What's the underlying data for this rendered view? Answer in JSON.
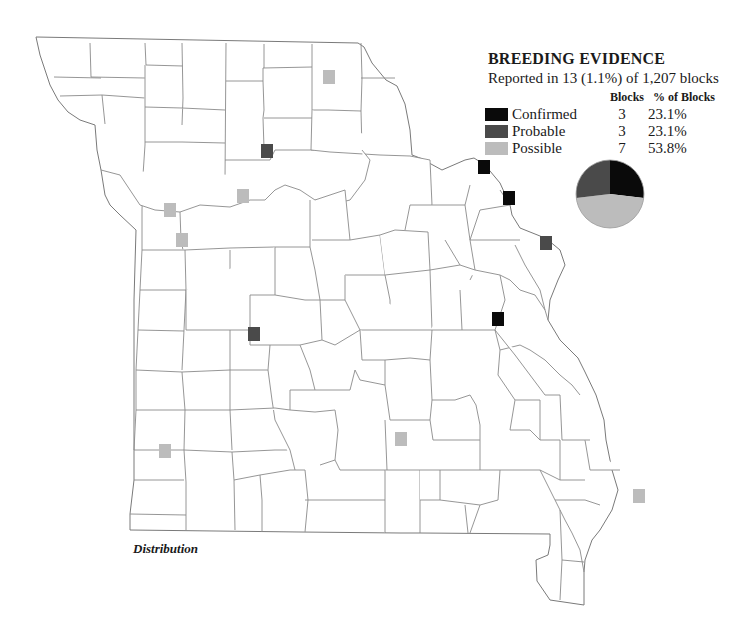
{
  "legend": {
    "title": "BREEDING EVIDENCE",
    "subtitle": "Reported in 13 (1.1%) of 1,207 blocks",
    "col_blocks": "Blocks",
    "col_pct": "% of Blocks",
    "rows": [
      {
        "label": "Confirmed",
        "blocks": "3",
        "pct": "23.1%",
        "color": "#0a0a0a"
      },
      {
        "label": "Probable",
        "blocks": "3",
        "pct": "23.1%",
        "color": "#4a4a4a"
      },
      {
        "label": "Possible",
        "blocks": "7",
        "pct": "53.8%",
        "color": "#bcbcbc"
      }
    ]
  },
  "map_label": "Distribution",
  "markers": [
    {
      "type": "Possible",
      "x": 329,
      "y": 77
    },
    {
      "type": "Probable",
      "x": 267,
      "y": 151
    },
    {
      "type": "Possible",
      "x": 243,
      "y": 196
    },
    {
      "type": "Possible",
      "x": 170,
      "y": 210
    },
    {
      "type": "Possible",
      "x": 182,
      "y": 240
    },
    {
      "type": "Confirmed",
      "x": 484,
      "y": 167
    },
    {
      "type": "Confirmed",
      "x": 509,
      "y": 198
    },
    {
      "type": "Probable",
      "x": 546,
      "y": 243
    },
    {
      "type": "Confirmed",
      "x": 498,
      "y": 319
    },
    {
      "type": "Probable",
      "x": 254,
      "y": 334
    },
    {
      "type": "Possible",
      "x": 401,
      "y": 439
    },
    {
      "type": "Possible",
      "x": 165,
      "y": 451
    },
    {
      "type": "Possible",
      "x": 639,
      "y": 496
    }
  ],
  "chart_data": {
    "type": "pie",
    "title": "BREEDING EVIDENCE",
    "categories": [
      "Confirmed",
      "Probable",
      "Possible"
    ],
    "values": [
      3,
      3,
      7
    ],
    "percentages": [
      23.1,
      23.1,
      53.8
    ],
    "colors": [
      "#0a0a0a",
      "#4a4a4a",
      "#bcbcbc"
    ],
    "total_blocks": 1207,
    "reported_blocks": 13
  }
}
